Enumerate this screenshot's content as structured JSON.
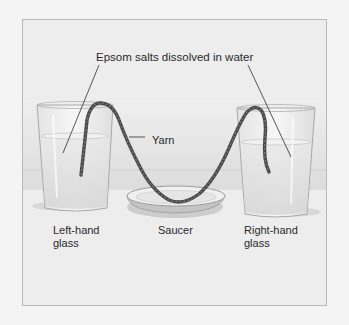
{
  "diagram": {
    "title_label": "Epsom salts dissolved in water",
    "labels": {
      "yarn": "Yarn",
      "left_glass_line1": "Left-hand",
      "left_glass_line2": "glass",
      "saucer": "Saucer",
      "right_glass_line1": "Right-hand",
      "right_glass_line2": "glass"
    },
    "components": [
      {
        "name": "Left-hand glass",
        "contains": "Epsom salts dissolved in water"
      },
      {
        "name": "Right-hand glass",
        "contains": "Epsom salts dissolved in water"
      },
      {
        "name": "Saucer",
        "position": "between glasses, under yarn"
      },
      {
        "name": "Yarn",
        "connects": [
          "Left-hand glass",
          "Right-hand glass"
        ],
        "sags_over": "Saucer"
      }
    ],
    "colors": {
      "background": "#ececec",
      "frame_border": "#b9b9b9",
      "yarn": "#4a4a4a",
      "glass_outline": "#9a9a9a",
      "text": "#2a2a2a"
    }
  }
}
